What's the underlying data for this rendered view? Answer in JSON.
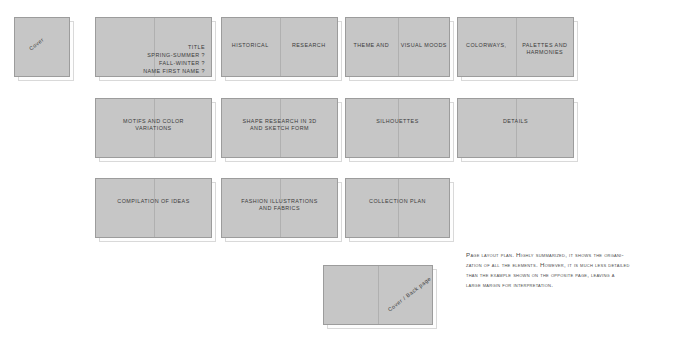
{
  "diagram": {
    "title": "Page layout plan",
    "background_color": "#ffffff",
    "card_fill_color": "#c6c6c6",
    "card_border_color": "#9c9c9c",
    "text_color": "#3a3a3a"
  },
  "spreads": [
    {
      "name": "cover",
      "kind": "single",
      "x": 14,
      "y": 17,
      "w": 56,
      "h": 60,
      "rotated_label": "Cover",
      "rotation": -38,
      "label_x": 14,
      "label_y": 24
    },
    {
      "name": "title",
      "kind": "spread",
      "x": 95,
      "y": 17,
      "w": 117,
      "h": 60,
      "lines": "TITLE\nSpring-Summer ?\nFall-Winter ?\nNAME First name ?",
      "align": "right",
      "label_top": 26
    },
    {
      "name": "historical-research",
      "kind": "spread",
      "x": 221,
      "y": 17,
      "w": 117,
      "h": 60,
      "left_text": "HISTORICAL",
      "right_text": "RESEARCH",
      "label_top": 25
    },
    {
      "name": "theme-visual-moods",
      "kind": "spread",
      "x": 345,
      "y": 17,
      "w": 105,
      "h": 60,
      "left_text": "THEME AND",
      "right_text": "VISUAL MOODS",
      "label_top": 25
    },
    {
      "name": "colorways-palettes",
      "kind": "spread",
      "x": 457,
      "y": 17,
      "w": 117,
      "h": 60,
      "left_text": "COLORWAYS,",
      "right_text": "PALETTES AND\nHARMONIES",
      "label_top": 25
    },
    {
      "name": "motifs-color-variations",
      "kind": "spread",
      "x": 95,
      "y": 98,
      "w": 117,
      "h": 60,
      "lines": "MOTIFS AND COLOR\nVARIATIONS",
      "align": "center",
      "label_top": 20
    },
    {
      "name": "shape-research",
      "kind": "spread",
      "x": 221,
      "y": 98,
      "w": 117,
      "h": 60,
      "lines": "SHAPE RESEARCH IN 3D\nAND SKETCH FORM",
      "align": "center",
      "label_top": 20
    },
    {
      "name": "silhouettes",
      "kind": "spread",
      "x": 345,
      "y": 98,
      "w": 105,
      "h": 60,
      "lines": "SILHOUETTES",
      "align": "center",
      "label_top": 20
    },
    {
      "name": "details",
      "kind": "spread",
      "x": 457,
      "y": 98,
      "w": 117,
      "h": 60,
      "lines": "DETAILS",
      "align": "center",
      "label_top": 20
    },
    {
      "name": "compilation-of-ideas",
      "kind": "spread",
      "x": 95,
      "y": 178,
      "w": 117,
      "h": 60,
      "lines": "COMPILATION OF IDEAS",
      "align": "center",
      "label_top": 20
    },
    {
      "name": "fashion-illustrations",
      "kind": "spread",
      "x": 221,
      "y": 178,
      "w": 117,
      "h": 60,
      "lines": "FASHION ILLUSTRATIONS\nAND FABRICS",
      "align": "center",
      "label_top": 20
    },
    {
      "name": "collection-plan",
      "kind": "spread",
      "x": 345,
      "y": 178,
      "w": 105,
      "h": 60,
      "lines": "COLLECTION PLAN",
      "align": "center",
      "label_top": 20
    },
    {
      "name": "cover-back-page",
      "kind": "spread",
      "x": 323,
      "y": 265,
      "w": 110,
      "h": 60,
      "rotated_label": "Cover / Back page",
      "rotation": -38,
      "label_x": 60,
      "label_y": 26
    }
  ],
  "caption": {
    "text": "Page layout plan. Highly summarized, it shows the organi-\nzation of all the elements. However, it is much less detailed\nthan the example shown on the opposite page, leaving a\nlarge margin for interpretation.",
    "x": 466,
    "y": 250,
    "w": 224
  }
}
